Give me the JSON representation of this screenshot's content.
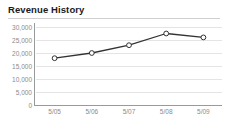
{
  "widget": {
    "title": "Revenue History",
    "background_color": "#ffffff",
    "divider_color": "#cfcfcf"
  },
  "chart_data": {
    "type": "line",
    "title": "Revenue History",
    "xlabel": "",
    "ylabel": "",
    "categories": [
      "5/05",
      "5/06",
      "5/07",
      "5/08",
      "5/09"
    ],
    "values": [
      18000,
      20000,
      23000,
      27500,
      26000
    ],
    "series": [
      {
        "name": "Revenue",
        "values": [
          18000,
          20000,
          23000,
          27500,
          26000
        ]
      }
    ],
    "ylim": [
      0,
      30000
    ],
    "ytick_values": [
      0,
      5000,
      10000,
      15000,
      20000,
      25000,
      30000
    ],
    "ytick_labels": [
      "0",
      "5,000",
      "10,000",
      "15,000",
      "20,000",
      "25,000",
      "30,000"
    ],
    "xtick_labels": [
      "5/05",
      "5/06",
      "5/07",
      "5/08",
      "5/09"
    ],
    "grid": true,
    "grid_axis": "y",
    "legend": false,
    "legend_position": "none",
    "line_color": "#333333",
    "marker_style": "circle",
    "marker_fill": "#ffffff",
    "marker_edge_color": "#333333",
    "gridline_color": "#e4e4e4",
    "axis_color": "#9a9a9a",
    "tick_label_color": "#8a8a8a"
  }
}
